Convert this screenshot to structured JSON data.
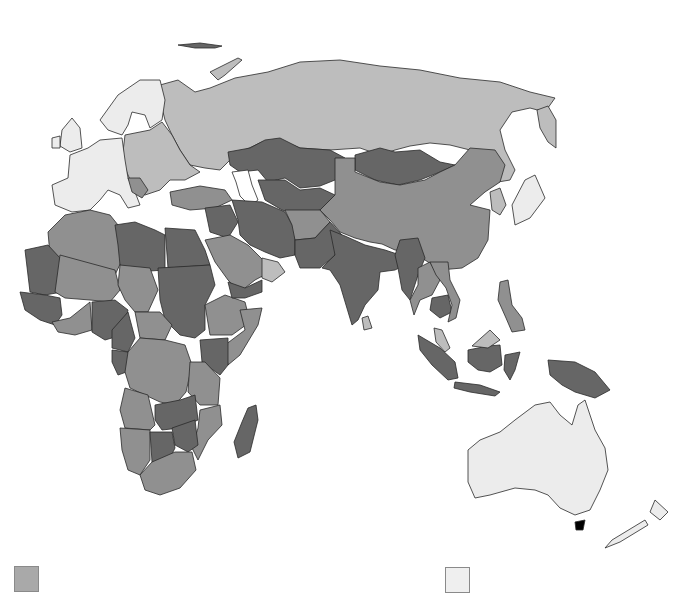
{
  "map": {
    "title": "",
    "projection": "Eastern Hemisphere (Europe, Africa, Asia, Oceania)",
    "shade_classes": {
      "very_light": "#ececec",
      "light": "#bdbdbd",
      "medium": "#909090",
      "dark": "#666666"
    },
    "regions": [
      {
        "name": "Western Europe",
        "class": "very_light"
      },
      {
        "name": "Scandinavia",
        "class": "very_light"
      },
      {
        "name": "Eastern Europe",
        "class": "light"
      },
      {
        "name": "Russia",
        "class": "light"
      },
      {
        "name": "Japan",
        "class": "very_light"
      },
      {
        "name": "South Korea",
        "class": "light"
      },
      {
        "name": "Australia",
        "class": "very_light"
      },
      {
        "name": "New Zealand",
        "class": "very_light"
      },
      {
        "name": "Turkey",
        "class": "medium"
      },
      {
        "name": "Saudi Arabia",
        "class": "medium"
      },
      {
        "name": "Oman",
        "class": "light"
      },
      {
        "name": "Yemen",
        "class": "dark"
      },
      {
        "name": "Iran",
        "class": "dark"
      },
      {
        "name": "Iraq",
        "class": "dark"
      },
      {
        "name": "Kazakhstan",
        "class": "dark"
      },
      {
        "name": "Central Asia",
        "class": "dark"
      },
      {
        "name": "Afghanistan",
        "class": "medium"
      },
      {
        "name": "Pakistan",
        "class": "dark"
      },
      {
        "name": "India",
        "class": "dark"
      },
      {
        "name": "Sri Lanka",
        "class": "light"
      },
      {
        "name": "Mongolia",
        "class": "dark"
      },
      {
        "name": "China",
        "class": "medium"
      },
      {
        "name": "Myanmar",
        "class": "dark"
      },
      {
        "name": "Thailand",
        "class": "medium"
      },
      {
        "name": "Cambodia",
        "class": "dark"
      },
      {
        "name": "Vietnam",
        "class": "medium"
      },
      {
        "name": "Malaysia",
        "class": "light"
      },
      {
        "name": "Philippines",
        "class": "medium"
      },
      {
        "name": "Indonesia",
        "class": "dark"
      },
      {
        "name": "Papua New Guinea",
        "class": "dark"
      },
      {
        "name": "North Africa (Algeria/Morocco)",
        "class": "medium"
      },
      {
        "name": "Libya",
        "class": "dark"
      },
      {
        "name": "Egypt",
        "class": "dark"
      },
      {
        "name": "Sudan",
        "class": "dark"
      },
      {
        "name": "Mauritania",
        "class": "dark"
      },
      {
        "name": "Mali/Niger",
        "class": "medium"
      },
      {
        "name": "Nigeria",
        "class": "dark"
      },
      {
        "name": "Ethiopia",
        "class": "medium"
      },
      {
        "name": "Somalia",
        "class": "medium"
      },
      {
        "name": "Kenya",
        "class": "dark"
      },
      {
        "name": "DR Congo",
        "class": "medium"
      },
      {
        "name": "Tanzania",
        "class": "medium"
      },
      {
        "name": "Angola",
        "class": "medium"
      },
      {
        "name": "Zambia",
        "class": "dark"
      },
      {
        "name": "Zimbabwe",
        "class": "dark"
      },
      {
        "name": "Mozambique",
        "class": "medium"
      },
      {
        "name": "Botswana",
        "class": "dark"
      },
      {
        "name": "Namibia",
        "class": "medium"
      },
      {
        "name": "South Africa",
        "class": "medium"
      },
      {
        "name": "Madagascar",
        "class": "dark"
      }
    ]
  },
  "legend": {
    "items": [
      {
        "swatch_color": "#a9a9a9",
        "label": ""
      },
      {
        "swatch_color": "#efefef",
        "label": ""
      }
    ]
  }
}
